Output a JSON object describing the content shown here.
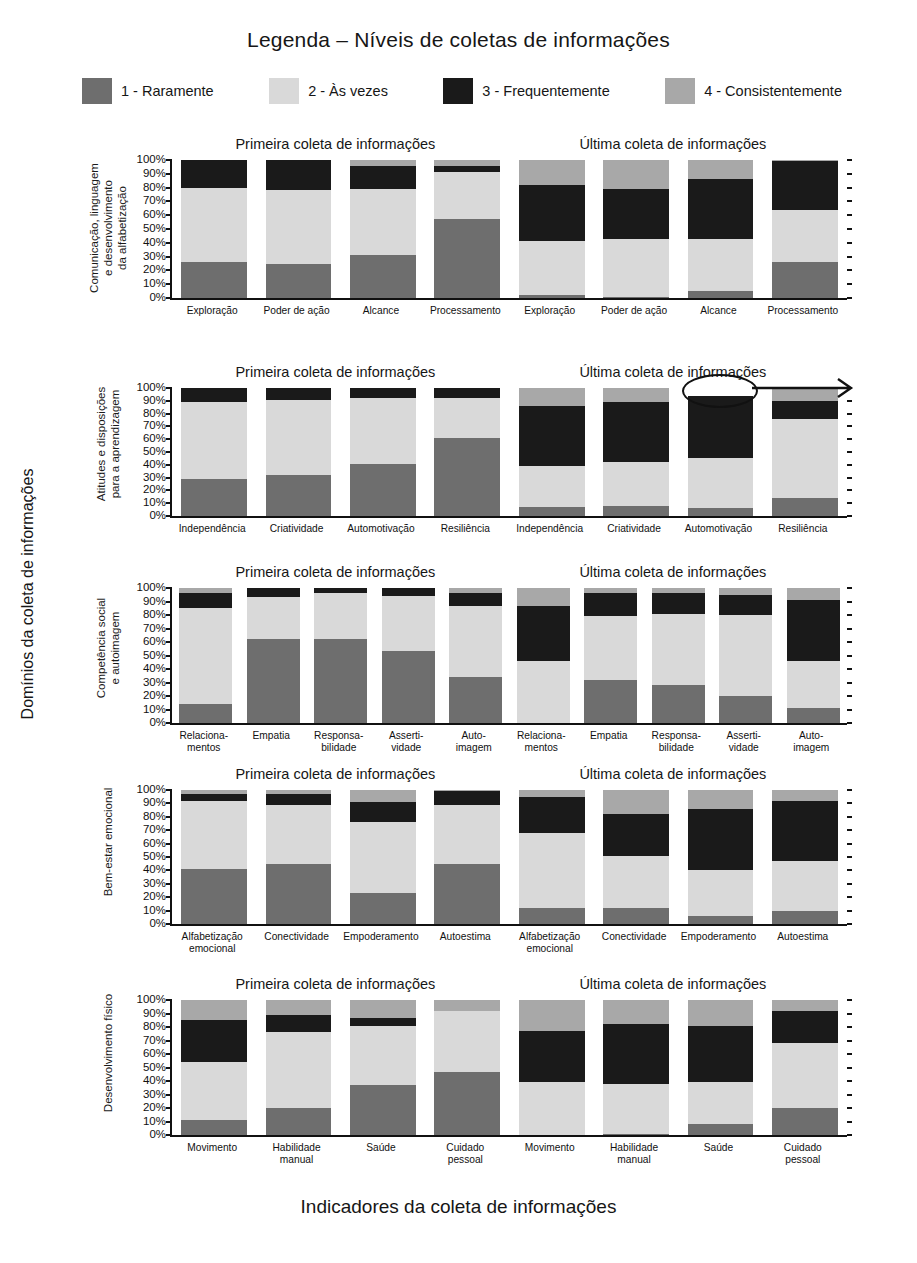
{
  "legend": {
    "title": "Legenda – Níveis de coletas de informações",
    "items": [
      {
        "label": "1 - Raramente",
        "color": "#6e6e6e"
      },
      {
        "label": "2 - Às vezes",
        "color": "#d9d9d9"
      },
      {
        "label": "3 - Frequentemente",
        "color": "#1a1a1a"
      },
      {
        "label": "4 - Consistentemente",
        "color": "#a8a8a8"
      }
    ]
  },
  "axes": {
    "left_title": "Domínios da coleta de informações",
    "bottom_title": "Indicadores da coleta de informações",
    "side_note": "Um espaço vazio no topo de um gráfico indica erros na entrada de dados, isto é, um ou mais escores de dados estão faltando, fazendo a soma dos percentuais não chegar a 100%"
  },
  "group_titles": {
    "first": "Primeira coleta de informações",
    "last": "Última coleta de informações"
  },
  "ytick_labels": [
    "0%",
    "10%",
    "20%",
    "30%",
    "40%",
    "50%",
    "60%",
    "70%",
    "80%",
    "90%",
    "100%"
  ],
  "chart_data": {
    "type": "bar",
    "subtype": "stacked-percentage",
    "title": "Legenda – Níveis de coletas de informações",
    "xlabel": "Indicadores da coleta de informações",
    "ylabel": "Domínios da coleta de informações",
    "ylim": [
      0,
      100
    ],
    "yticks": [
      0,
      10,
      20,
      30,
      40,
      50,
      60,
      70,
      80,
      90,
      100
    ],
    "grid": false,
    "legend_position": "top",
    "series_names": [
      "1 - Raramente",
      "2 - Às vezes",
      "3 - Frequentemente",
      "4 - Consistentemente"
    ],
    "series_colors": [
      "#6e6e6e",
      "#d9d9d9",
      "#1a1a1a",
      "#a8a8a8"
    ],
    "panels": [
      {
        "domain": "Comunicação, linguagem e desenvolvimento da alfabetização",
        "domain_lines": [
          "Comunicação, linguagem",
          "e desenvolvimento",
          "da alfabetização"
        ],
        "groups": [
          {
            "name": "Primeira coleta de informações",
            "categories": [
              "Exploração",
              "Poder de ação",
              "Alcance",
              "Processamento"
            ],
            "bars": [
              {
                "category": "Exploração",
                "values": [
                  26,
                  54,
                  20,
                  0
                ]
              },
              {
                "category": "Poder de ação",
                "values": [
                  25,
                  53,
                  22,
                  0
                ]
              },
              {
                "category": "Alcance",
                "values": [
                  31,
                  48,
                  17,
                  4
                ]
              },
              {
                "category": "Processamento",
                "values": [
                  57,
                  34,
                  5,
                  4
                ]
              }
            ]
          },
          {
            "name": "Última coleta de informações",
            "categories": [
              "Exploração",
              "Poder de ação",
              "Alcance",
              "Processamento"
            ],
            "bars": [
              {
                "category": "Exploração",
                "values": [
                  2,
                  39,
                  41,
                  18
                ]
              },
              {
                "category": "Poder de ação",
                "values": [
                  1,
                  42,
                  36,
                  21
                ]
              },
              {
                "category": "Alcance",
                "values": [
                  5,
                  38,
                  43,
                  14
                ]
              },
              {
                "category": "Processamento",
                "values": [
                  26,
                  38,
                  35,
                  1
                ]
              }
            ]
          }
        ]
      },
      {
        "domain": "Atitudes e disposições para a aprendizagem",
        "domain_lines": [
          "Atitudes e disposições",
          "para a aprendizagem"
        ],
        "groups": [
          {
            "name": "Primeira coleta de informações",
            "categories": [
              "Independência",
              "Criatividade",
              "Automotivação",
              "Resiliência"
            ],
            "bars": [
              {
                "category": "Independência",
                "values": [
                  29,
                  60,
                  11,
                  0
                ]
              },
              {
                "category": "Criatividade",
                "values": [
                  32,
                  59,
                  9,
                  0
                ]
              },
              {
                "category": "Automotivação",
                "values": [
                  41,
                  51,
                  8,
                  0
                ]
              },
              {
                "category": "Resiliência",
                "values": [
                  61,
                  31,
                  8,
                  0
                ]
              }
            ]
          },
          {
            "name": "Última coleta de informações",
            "categories": [
              "Independência",
              "Criatividade",
              "Automotivação",
              "Resiliência"
            ],
            "bars": [
              {
                "category": "Independência",
                "values": [
                  7,
                  32,
                  47,
                  14
                ]
              },
              {
                "category": "Criatividade",
                "values": [
                  8,
                  34,
                  47,
                  11
                ]
              },
              {
                "category": "Automotivação",
                "values": [
                  6,
                  39,
                  49,
                  0
                ]
              },
              {
                "category": "Resiliência",
                "values": [
                  14,
                  62,
                  14,
                  10
                ]
              }
            ]
          }
        ]
      },
      {
        "domain": "Competência social e autoimagem",
        "domain_lines": [
          "Competência social",
          "e autoimagem"
        ],
        "groups": [
          {
            "name": "Primeira coleta de informações",
            "categories": [
              "Relacionamentos",
              "Empatia",
              "Responsabilidade",
              "Assertividade",
              "Autoimagem"
            ],
            "bars": [
              {
                "category": "Relacionamentos",
                "values": [
                  14,
                  71,
                  11,
                  4
                ]
              },
              {
                "category": "Empatia",
                "values": [
                  62,
                  31,
                  7,
                  0
                ]
              },
              {
                "category": "Responsabilidade",
                "values": [
                  62,
                  34,
                  4,
                  0
                ]
              },
              {
                "category": "Assertividade",
                "values": [
                  53,
                  41,
                  6,
                  0
                ]
              },
              {
                "category": "Autoimagem",
                "values": [
                  34,
                  53,
                  9,
                  4
                ]
              }
            ]
          },
          {
            "name": "Última coleta de informações",
            "categories": [
              "Relacionamentos",
              "Empatia",
              "Responsabilidade",
              "Assertividade",
              "Autoimagem"
            ],
            "bars": [
              {
                "category": "Relacionamentos",
                "values": [
                  0,
                  46,
                  41,
                  13
                ]
              },
              {
                "category": "Empatia",
                "values": [
                  32,
                  47,
                  17,
                  4
                ]
              },
              {
                "category": "Responsabilidade",
                "values": [
                  28,
                  53,
                  15,
                  4
                ]
              },
              {
                "category": "Assertividade",
                "values": [
                  20,
                  60,
                  15,
                  5
                ]
              },
              {
                "category": "Autoimagem",
                "values": [
                  11,
                  35,
                  45,
                  9
                ]
              }
            ]
          }
        ]
      },
      {
        "domain": "Bem-estar emocional",
        "domain_lines": [
          "Bem-estar emocional"
        ],
        "groups": [
          {
            "name": "Primeira coleta de informações",
            "categories": [
              "Alfabetização emocional",
              "Conectividade",
              "Empoderamento",
              "Autoestima"
            ],
            "bars": [
              {
                "category": "Alfabetização emocional",
                "values": [
                  41,
                  51,
                  5,
                  3
                ]
              },
              {
                "category": "Conectividade",
                "values": [
                  45,
                  44,
                  8,
                  3
                ]
              },
              {
                "category": "Empoderamento",
                "values": [
                  23,
                  53,
                  15,
                  9
                ]
              },
              {
                "category": "Autoestima",
                "values": [
                  45,
                  44,
                  10,
                  1
                ]
              }
            ]
          },
          {
            "name": "Última coleta de informações",
            "categories": [
              "Alfabetização emocional",
              "Conectividade",
              "Empoderamento",
              "Autoestima"
            ],
            "bars": [
              {
                "category": "Alfabetização emocional",
                "values": [
                  12,
                  56,
                  27,
                  5
                ]
              },
              {
                "category": "Conectividade",
                "values": [
                  12,
                  39,
                  31,
                  18
                ]
              },
              {
                "category": "Empoderamento",
                "values": [
                  6,
                  34,
                  46,
                  14
                ]
              },
              {
                "category": "Autoestima",
                "values": [
                  10,
                  37,
                  45,
                  8
                ]
              }
            ]
          }
        ]
      },
      {
        "domain": "Desenvolvimento físico",
        "domain_lines": [
          "Desenvolvimento físico"
        ],
        "groups": [
          {
            "name": "Primeira coleta de informações",
            "categories": [
              "Movimento",
              "Habilidade manual",
              "Saúde",
              "Cuidado pessoal"
            ],
            "bars": [
              {
                "category": "Movimento",
                "values": [
                  11,
                  43,
                  31,
                  15
                ]
              },
              {
                "category": "Habilidade manual",
                "values": [
                  20,
                  56,
                  13,
                  11
                ]
              },
              {
                "category": "Saúde",
                "values": [
                  37,
                  44,
                  6,
                  13
                ]
              },
              {
                "category": "Cuidado pessoal",
                "values": [
                  47,
                  45,
                  0,
                  8
                ]
              }
            ]
          },
          {
            "name": "Última coleta de informações",
            "categories": [
              "Movimento",
              "Habilidade manual",
              "Saúde",
              "Cuidado pessoal"
            ],
            "bars": [
              {
                "category": "Movimento",
                "values": [
                  0,
                  39,
                  38,
                  23
                ]
              },
              {
                "category": "Habilidade manual",
                "values": [
                  1,
                  37,
                  44,
                  18
                ]
              },
              {
                "category": "Saúde",
                "values": [
                  8,
                  31,
                  42,
                  19
                ]
              },
              {
                "category": "Cuidado pessoal",
                "values": [
                  20,
                  48,
                  24,
                  8
                ]
              }
            ]
          }
        ]
      }
    ],
    "annotation": {
      "type": "ellipse-with-arrow",
      "target_panel": 1,
      "target_group": "Última coleta de informações",
      "target_bar": "Automotivação",
      "meaning": "Um espaço vazio no topo de um gráfico indica erros na entrada de dados, isto é, um ou mais escores de dados estão faltando, fazendo a soma dos percentuais não chegar a 100%"
    }
  }
}
